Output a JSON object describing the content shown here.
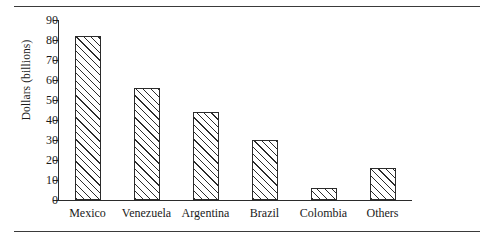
{
  "figure": {
    "ylabel": "Dollars (billions)"
  },
  "chart_data": {
    "type": "bar",
    "title": "",
    "xlabel": "",
    "ylabel": "Dollars (billions)",
    "categories": [
      "Mexico",
      "Venezuela",
      "Argentina",
      "Brazil",
      "Colombia",
      "Others"
    ],
    "values": [
      82,
      56,
      44,
      30,
      6,
      16
    ],
    "ylim": [
      0,
      90
    ],
    "yticks": [
      0,
      10,
      20,
      30,
      40,
      50,
      60,
      70,
      80,
      90
    ],
    "ytick_labels": [
      "0",
      "10",
      "20",
      "30",
      "40",
      "50",
      "60",
      "70",
      "80",
      "90"
    ],
    "grid": false,
    "legend": "none",
    "bar_fill": "diagonal-hatch",
    "bar_edge_color": "#2b2b2b",
    "axis_color": "#2b2b2b"
  }
}
